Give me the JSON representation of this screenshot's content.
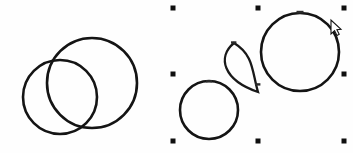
{
  "app": {
    "canvas_label": "drawing-canvas",
    "background_color": "#fefefe",
    "stroke_color": "#141414",
    "handle_color": "#0f0f0f",
    "width": 353,
    "height": 153
  },
  "groups": [
    {
      "id": "left-group",
      "label": "Unselected shape group",
      "selected": "false",
      "shapes": [
        {
          "name": "circle-left-small",
          "type": "circle",
          "cx": 60,
          "cy": 97,
          "r": 37
        },
        {
          "name": "circle-left-large",
          "type": "circle",
          "cx": 92,
          "cy": 83,
          "r": 45
        }
      ]
    },
    {
      "id": "right-group",
      "label": "Selected shape group",
      "selected": "true",
      "shapes": [
        {
          "name": "circle-right-small",
          "type": "circle",
          "cx": 209,
          "cy": 110,
          "r": 29
        },
        {
          "name": "lens-shape",
          "type": "lens",
          "top_x": 234,
          "top_y": 43,
          "bottom_x": 258,
          "bottom_y": 92,
          "bulge": 17
        },
        {
          "name": "circle-right-large",
          "type": "circle",
          "cx": 300,
          "cy": 52,
          "r": 39
        }
      ]
    }
  ],
  "selection": {
    "name": "selection-bounding-box",
    "visible": "true",
    "bounds": {
      "left": 173,
      "top": 8,
      "right": 344,
      "bottom": 141
    },
    "handle_size": 5,
    "handles": [
      {
        "name": "handle-top-left",
        "x": 173,
        "y": 8
      },
      {
        "name": "handle-top-center",
        "x": 258,
        "y": 8
      },
      {
        "name": "handle-top-right",
        "x": 344,
        "y": 8
      },
      {
        "name": "handle-middle-left",
        "x": 173,
        "y": 74
      },
      {
        "name": "handle-middle-right",
        "x": 344,
        "y": 74
      },
      {
        "name": "handle-bottom-left",
        "x": 173,
        "y": 141
      },
      {
        "name": "handle-bottom-center",
        "x": 258,
        "y": 141
      },
      {
        "name": "handle-bottom-right",
        "x": 344,
        "y": 141
      }
    ]
  },
  "nodes": [
    {
      "name": "node-marker-large-circle-top",
      "x": 300,
      "y": 13
    },
    {
      "name": "node-marker-lens-top",
      "x": 234,
      "y": 43
    },
    {
      "name": "node-marker-lens-bottom",
      "x": 258,
      "y": 92
    },
    {
      "name": "node-marker-small-circle-top",
      "x": 209,
      "y": 81
    }
  ],
  "cursor": {
    "name": "mouse-cursor",
    "kind": "arrow-pointer",
    "x": 331,
    "y": 27
  }
}
